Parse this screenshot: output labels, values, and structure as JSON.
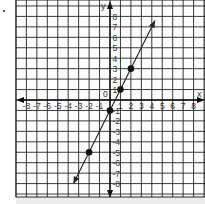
{
  "chart_data": {
    "type": "line",
    "title": "",
    "xlabel": "x",
    "ylabel": "y",
    "origin_label": "0",
    "xlim": [
      -8.5,
      8.8
    ],
    "ylim": [
      -9.3,
      9.6
    ],
    "grid": true,
    "x_ticks": [
      -8,
      -7,
      -6,
      -5,
      -4,
      -3,
      -2,
      -1,
      1,
      2,
      3,
      4,
      5,
      6,
      7,
      8
    ],
    "y_ticks": [
      8,
      7,
      6,
      5,
      4,
      3,
      2,
      1,
      -1,
      -2,
      -3,
      -4,
      -5,
      -6,
      -7,
      -8
    ],
    "series": [
      {
        "name": "line",
        "equation": "y = 2x - 1",
        "slope": 2,
        "intercept": -1,
        "points": [
          [
            -2,
            -5
          ],
          [
            0,
            -1
          ],
          [
            1,
            1
          ],
          [
            2,
            3
          ]
        ],
        "arrow_ends": [
          [
            -3.5,
            -8
          ],
          [
            4.3,
            7.6
          ]
        ]
      }
    ],
    "colors": {
      "grid": "#222222",
      "line": "#222222",
      "points": "#111111",
      "background": "#ffffff"
    }
  }
}
